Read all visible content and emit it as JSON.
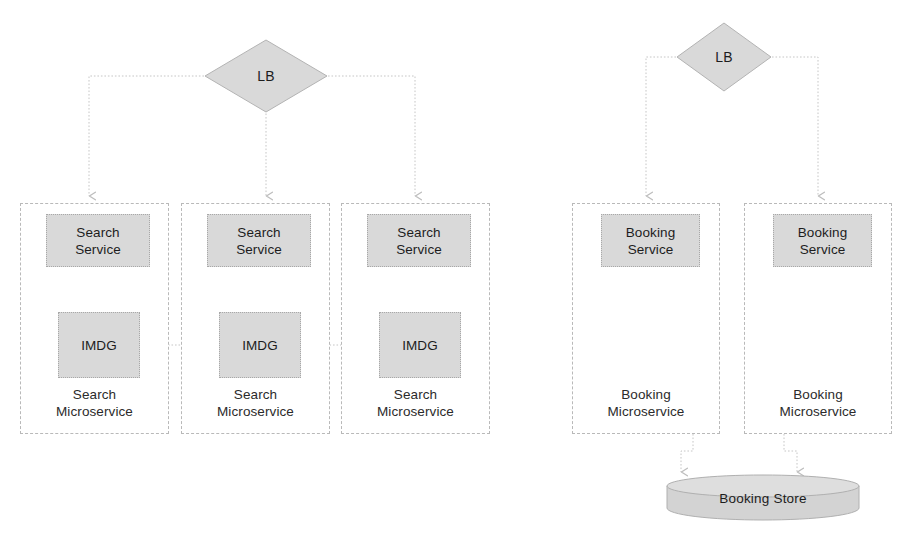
{
  "diagram": {
    "colors": {
      "node_fill": "#d9d9d9",
      "node_border": "#a8a8a8",
      "group_border": "#b9b9b9",
      "edge": "#c2c2c2",
      "text": "#1d1d1d",
      "background": "#ffffff"
    },
    "load_balancers": [
      {
        "id": "lb-search",
        "label": "LB",
        "shape": "diamond"
      },
      {
        "id": "lb-booking",
        "label": "LB",
        "shape": "diamond"
      }
    ],
    "search_groups": [
      {
        "id": "search-microservice-1",
        "group_label_line1": "Search",
        "group_label_line2": "Microservice",
        "service_label_line1": "Search",
        "service_label_line2": "Service",
        "cache_label": "IMDG"
      },
      {
        "id": "search-microservice-2",
        "group_label_line1": "Search",
        "group_label_line2": "Microservice",
        "service_label_line1": "Search",
        "service_label_line2": "Service",
        "cache_label": "IMDG"
      },
      {
        "id": "search-microservice-3",
        "group_label_line1": "Search",
        "group_label_line2": "Microservice",
        "service_label_line1": "Search",
        "service_label_line2": "Service",
        "cache_label": "IMDG"
      }
    ],
    "booking_groups": [
      {
        "id": "booking-microservice-1",
        "group_label_line1": "Booking",
        "group_label_line2": "Microservice",
        "service_label_line1": "Booking",
        "service_label_line2": "Service"
      },
      {
        "id": "booking-microservice-2",
        "group_label_line1": "Booking",
        "group_label_line2": "Microservice",
        "service_label_line1": "Booking",
        "service_label_line2": "Service"
      }
    ],
    "datastore": {
      "id": "booking-store",
      "label": "Booking Store",
      "shape": "cylinder"
    }
  }
}
